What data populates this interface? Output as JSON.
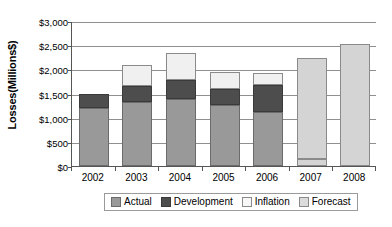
{
  "chart_data": {
    "type": "bar",
    "stacked": true,
    "title": "",
    "xlabel": "",
    "ylabel": "Losses(Millions$)",
    "categories": [
      "2002",
      "2003",
      "2004",
      "2005",
      "2006",
      "2007",
      "2008"
    ],
    "ylim": [
      0,
      3000
    ],
    "ytick_values": [
      0,
      500,
      1000,
      1500,
      2000,
      2500,
      3000
    ],
    "ytick_labels": [
      "$0",
      "$500",
      "$1,000",
      "$1,500",
      "$2,000",
      "$2,500",
      "$3,000"
    ],
    "grid": true,
    "grid_axis": "y",
    "legend_position": "bottom",
    "series": [
      {
        "name": "Actual",
        "color": "#999999",
        "values": [
          1200,
          1330,
          1390,
          1270,
          1120,
          0,
          0
        ]
      },
      {
        "name": "Development",
        "color": "#4d4d4d",
        "values": [
          300,
          320,
          395,
          315,
          555,
          0,
          0
        ]
      },
      {
        "name": "Inflation",
        "color": "#f0f0f0",
        "values": [
          0,
          450,
          555,
          365,
          250,
          0,
          0
        ]
      },
      {
        "name": "Forecast",
        "color": "#d4d4d4",
        "values": [
          0,
          0,
          0,
          0,
          0,
          2230,
          2520
        ]
      }
    ],
    "totals": [
      1500,
      2100,
      2340,
      1950,
      1925,
      2230,
      2520
    ]
  },
  "legend": {
    "items": [
      {
        "label": "Actual",
        "swatch": "actual"
      },
      {
        "label": "Development",
        "swatch": "development"
      },
      {
        "label": "Inflation",
        "swatch": "inflation"
      },
      {
        "label": "Forecast",
        "swatch": "forecast"
      }
    ]
  }
}
